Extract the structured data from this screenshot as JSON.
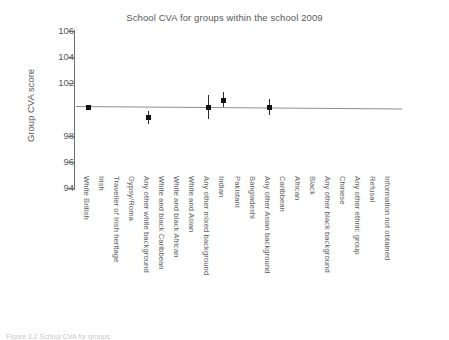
{
  "chart_data": {
    "type": "scatter",
    "title": "School CVA for groups within the school 2009",
    "xlabel": "",
    "ylabel": "Group CVA score",
    "ylim": [
      93.0,
      106.6
    ],
    "yticks": [
      106,
      104,
      102,
      98,
      96,
      94
    ],
    "ytick_labels": [
      "106",
      "104",
      "102",
      "98",
      "96",
      "94"
    ],
    "grid": false,
    "legend": "none",
    "categories": [
      "White British",
      "Irish",
      "Traveller of Irish heritage",
      "Gypsy/Roma",
      "Any other white background",
      "White and black Caribbean",
      "White and black African",
      "White and Asian",
      "Any other mixed background",
      "Indian",
      "Pakistani",
      "Bangladeshi",
      "Any other Asian background",
      "Caribbean",
      "African",
      "Black",
      "Any other black background",
      "Chinese",
      "Any other ethnic group",
      "Refusal",
      "Information not obtained"
    ],
    "series": [
      {
        "name": "Group CVA score",
        "points": [
          {
            "category": "White British",
            "x_index": 0,
            "value": 100.2,
            "err_low": 100.2,
            "err_high": 100.2
          },
          {
            "category": "Any other white background",
            "x_index": 4,
            "value": 99.4,
            "err_low": 98.9,
            "err_high": 99.9
          },
          {
            "category": "Any other mixed background",
            "x_index": 8,
            "value": 100.2,
            "err_low": 99.3,
            "err_high": 101.1
          },
          {
            "category": "Indian",
            "x_index": 9,
            "value": 100.7,
            "err_low": 100.2,
            "err_high": 101.3
          },
          {
            "category": "Any other Asian background",
            "x_index": 12,
            "value": 100.2,
            "err_low": 99.6,
            "err_high": 100.8
          }
        ]
      }
    ],
    "trend_line": {
      "y_start": 100.3,
      "y_end": 100.1,
      "color": "#8d8d8d"
    }
  },
  "colors": {
    "marker": "#111111",
    "error_bar": "#2b2b2b",
    "trend_line": "#8d8d8d",
    "axis": "#6d6d6d",
    "text": "#59595b",
    "background": "#ffffff"
  },
  "caption": {
    "text": "Figure 3.2 School CVA for groups"
  }
}
